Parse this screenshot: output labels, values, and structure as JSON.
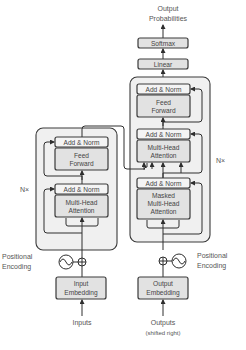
{
  "diagram": {
    "encoder": {
      "repeat_label": "N×",
      "blocks": [
        {
          "name": "add-norm-top",
          "label": "Add & Norm"
        },
        {
          "name": "feed-forward",
          "label_line1": "Feed",
          "label_line2": "Forward"
        },
        {
          "name": "add-norm-bottom",
          "label": "Add & Norm"
        },
        {
          "name": "multi-head-attention",
          "label_line1": "Multi-Head",
          "label_line2": "Attention"
        }
      ],
      "embedding": {
        "label_line1": "Input",
        "label_line2": "Embedding"
      },
      "positional_encoding": {
        "label_line1": "Positional",
        "label_line2": "Encoding"
      },
      "input_label": "Inputs"
    },
    "decoder": {
      "repeat_label": "N×",
      "blocks": [
        {
          "name": "add-norm-top",
          "label": "Add & Norm"
        },
        {
          "name": "feed-forward",
          "label_line1": "Feed",
          "label_line2": "Forward"
        },
        {
          "name": "add-norm-middle",
          "label": "Add & Norm"
        },
        {
          "name": "multi-head-attention",
          "label_line1": "Multi-Head",
          "label_line2": "Attention"
        },
        {
          "name": "add-norm-bottom",
          "label": "Add & Norm"
        },
        {
          "name": "masked-multi-head-attention",
          "label_line1": "Masked",
          "label_line2": "Multi-Head",
          "label_line3": "Attention"
        }
      ],
      "embedding": {
        "label_line1": "Output",
        "label_line2": "Embedding"
      },
      "positional_encoding": {
        "label_line1": "Positional",
        "label_line2": "Encoding"
      },
      "input_label_line1": "Outputs",
      "input_label_line2": "(shifted right)"
    },
    "head": {
      "linear": "Linear",
      "softmax": "Softmax",
      "output_line1": "Output",
      "output_line2": "Probabilities"
    }
  }
}
